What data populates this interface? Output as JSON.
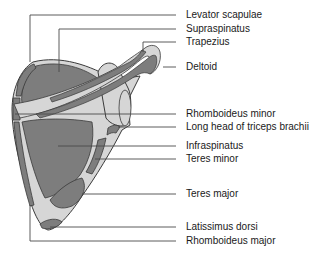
{
  "figure": {
    "colors": {
      "muscle": "#7d7d7d",
      "bone": "#d6d6d6",
      "outline": "#3a3a3a",
      "leader": "#4a4a4a",
      "text": "#1a1a1a"
    }
  },
  "labels": [
    {
      "id": "levator-scapulae",
      "text": "Levator scapulae",
      "y": 9
    },
    {
      "id": "supraspinatus",
      "text": "Supraspinatus",
      "y": 23
    },
    {
      "id": "trapezius",
      "text": "Trapezius",
      "y": 36
    },
    {
      "id": "deltoid",
      "text": "Deltoid",
      "y": 61
    },
    {
      "id": "rhomboideus-minor",
      "text": "Rhomboideus minor",
      "y": 108
    },
    {
      "id": "long-head-triceps",
      "text": "Long head of triceps brachii",
      "y": 121
    },
    {
      "id": "infraspinatus",
      "text": "Infraspinatus",
      "y": 140
    },
    {
      "id": "teres-minor",
      "text": "Teres minor",
      "y": 153
    },
    {
      "id": "teres-major",
      "text": "Teres major",
      "y": 188
    },
    {
      "id": "latissimus-dorsi",
      "text": "Latissimus dorsi",
      "y": 221
    },
    {
      "id": "rhomboideus-major",
      "text": "Rhomboideus major",
      "y": 235
    }
  ]
}
